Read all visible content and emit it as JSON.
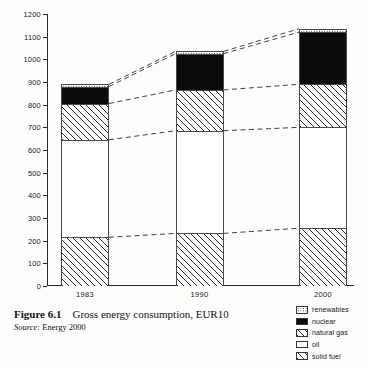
{
  "chart_data": {
    "type": "bar",
    "subtype": "stacked-bar-with-connectors",
    "title": "Gross energy consumption, EUR10",
    "xlabel": "",
    "ylabel": "",
    "ylim": [
      0,
      1200
    ],
    "ytick_step": 100,
    "yticks": [
      0,
      100,
      200,
      300,
      400,
      500,
      600,
      700,
      800,
      900,
      1000,
      1100,
      1200
    ],
    "ytick_labels": [
      "0",
      "100",
      "200",
      "300",
      "400",
      "500",
      "600",
      "700",
      "800",
      "900",
      "1000",
      "1100",
      "1200"
    ],
    "categories": [
      "1983",
      "1990",
      "2000"
    ],
    "grid": false,
    "legend_position": "bottom-right",
    "stack_order_bottom_to_top": [
      "solid fuel",
      "oil",
      "natural gas",
      "nuclear",
      "renewables"
    ],
    "series": [
      {
        "name": "solid fuel",
        "values": [
          215,
          232,
          255
        ]
      },
      {
        "name": "oil",
        "values": [
          430,
          453,
          445
        ]
      },
      {
        "name": "natural gas",
        "values": [
          160,
          180,
          190
        ]
      },
      {
        "name": "nuclear",
        "values": [
          75,
          160,
          230
        ]
      },
      {
        "name": "renewables",
        "values": [
          10,
          10,
          15
        ]
      }
    ],
    "cumulative_tops": {
      "1983": {
        "solid fuel": 215,
        "oil": 645,
        "natural gas": 805,
        "nuclear": 880,
        "renewables": 890
      },
      "1990": {
        "solid fuel": 232,
        "oil": 685,
        "natural gas": 865,
        "nuclear": 1025,
        "renewables": 1035
      },
      "2000": {
        "solid fuel": 255,
        "oil": 700,
        "natural gas": 890,
        "nuclear": 1120,
        "renewables": 1135
      }
    },
    "totals": [
      890,
      1035,
      1135
    ],
    "connector_levels": [
      "solid fuel",
      "oil",
      "natural gas",
      "nuclear",
      "renewables"
    ]
  },
  "legend": {
    "items": [
      {
        "label": "renewables",
        "pattern": "dotted"
      },
      {
        "label": "nuclear",
        "pattern": "solid-black"
      },
      {
        "label": "natural gas",
        "pattern": "hatched"
      },
      {
        "label": "oil",
        "pattern": "blank"
      },
      {
        "label": "solid fuel",
        "pattern": "hatched"
      }
    ]
  },
  "caption": {
    "figure_number": "Figure 6.1",
    "title": "Gross energy consumption, EUR10",
    "source_word": "Source:",
    "source_value": "Energy 2000"
  }
}
